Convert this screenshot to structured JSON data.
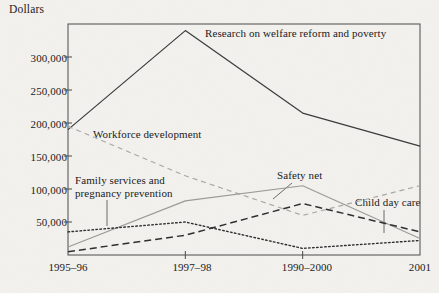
{
  "chart_data": {
    "type": "line",
    "title": "",
    "subtitle": "",
    "xlabel": "",
    "ylabel": "Dollars",
    "categories": [
      "1995–96",
      "1997–98",
      "1990–2000",
      "2001"
    ],
    "ylim": [
      0,
      350000
    ],
    "yticks": [
      50000,
      100000,
      150000,
      200000,
      250000,
      300000
    ],
    "ytick_labels": [
      "50,000",
      "100,000",
      "150,000",
      "200,000",
      "250,000",
      "300,000"
    ],
    "grid": false,
    "legend": "inline-annotations",
    "series": [
      {
        "name": "Research on welfare reform and poverty",
        "style": "solid",
        "color": "#3a3a3a",
        "width": 1.2,
        "values": [
          190000,
          340000,
          215000,
          165000
        ]
      },
      {
        "name": "Workforce development",
        "style": "dashed",
        "color": "#a8a8a4",
        "width": 1.2,
        "values": [
          195000,
          120000,
          60000,
          105000
        ]
      },
      {
        "name": "Family services and pregnancy prevention",
        "style": "solid",
        "color": "#9a9a96",
        "width": 1.1,
        "values": [
          12000,
          82000,
          105000,
          25000
        ]
      },
      {
        "name": "Safety net",
        "style": "dashed",
        "color": "#2e2e2e",
        "width": 1.5,
        "values": [
          5000,
          30000,
          78000,
          35000
        ]
      },
      {
        "name": "Child day care",
        "style": "dotted",
        "color": "#2e2e2e",
        "width": 1.4,
        "values": [
          35000,
          50000,
          10000,
          22000
        ]
      }
    ],
    "annotations": [
      {
        "text": "Research on welfare reform and poverty",
        "series": "Research on welfare reform and poverty",
        "leader": false
      },
      {
        "text": "Workforce development",
        "series": "Workforce development",
        "leader": false
      },
      {
        "text": "Family services and\npregnancy prevention",
        "series": "Family services and pregnancy prevention",
        "leader": true
      },
      {
        "text": "Safety net",
        "series": "Safety net",
        "leader": true
      },
      {
        "text": "Child day care",
        "series": "Child day care",
        "leader": true
      }
    ]
  },
  "labels": {
    "y_axis_title": "Dollars",
    "ytick_0": "300,000",
    "ytick_1": "250,000",
    "ytick_2": "200,000",
    "ytick_3": "150,000",
    "ytick_4": "100,000",
    "ytick_5": "50,000",
    "xtick_0": "1995–96",
    "xtick_1": "1997–98",
    "xtick_2": "1990–2000",
    "xtick_3": "2001",
    "series_research": "Research on welfare reform and poverty",
    "series_workforce": "Workforce development",
    "series_family_line1": "Family services and",
    "series_family_line2": "pregnancy prevention",
    "series_safety": "Safety net",
    "series_childcare": "Child day care"
  },
  "colors": {
    "background": "#f2f1ee",
    "frame": "#4a4a4a",
    "ink": "#1a1a1a",
    "series_research": "#3a3a3a",
    "series_workforce": "#a8a8a4",
    "series_family": "#9a9a96",
    "series_safety": "#2e2e2e",
    "series_childcare": "#2e2e2e"
  }
}
